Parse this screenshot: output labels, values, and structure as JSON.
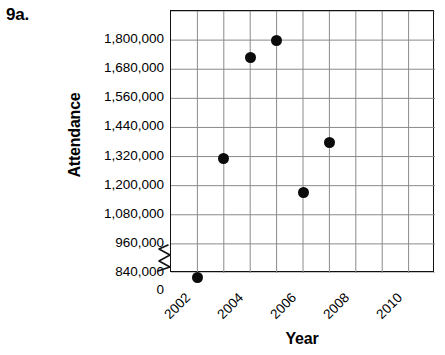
{
  "figure": {
    "problem_number": "9a."
  },
  "chart_data": {
    "type": "scatter",
    "title": "",
    "xlabel": "Year",
    "ylabel": "Attendance",
    "grid": true,
    "legend": null,
    "axis_break": {
      "axis": "y",
      "between": [
        0,
        840000
      ],
      "symbol": "zigzag"
    },
    "x": [
      2002,
      2003,
      2004,
      2005,
      2006,
      2007
    ],
    "values": [
      820000,
      1310000,
      1730000,
      1800000,
      1170000,
      1380000
    ],
    "points": [
      {
        "x": 2002,
        "y": 820000
      },
      {
        "x": 2003,
        "y": 1310000
      },
      {
        "x": 2004,
        "y": 1730000
      },
      {
        "x": 2005,
        "y": 1800000
      },
      {
        "x": 2006,
        "y": 1170000
      },
      {
        "x": 2007,
        "y": 1380000
      }
    ],
    "xlim": [
      2001,
      2011
    ],
    "ylim": [
      840000,
      1920000
    ],
    "x_major_step": 2,
    "x_minor_step": 1,
    "y_tick_values": [
      1800000,
      1680000,
      1560000,
      1440000,
      1320000,
      1200000,
      1080000,
      960000,
      840000,
      0
    ],
    "y_tick_labels": [
      "1,800,000",
      "1,680,000",
      "1,560,000",
      "1,440,000",
      "1,320,000",
      "1,200,000",
      "1,080,000",
      "960,000",
      "840,000",
      "0"
    ],
    "x_tick_labels": [
      "2002",
      "2004",
      "2006",
      "2008",
      "2010"
    ],
    "x_tick_values": [
      2002,
      2004,
      2006,
      2008,
      2010
    ],
    "colors": {
      "point": "#0b0b0b",
      "grid": "#8a8a8a",
      "axis": "#111111",
      "background": "#ffffff"
    }
  }
}
